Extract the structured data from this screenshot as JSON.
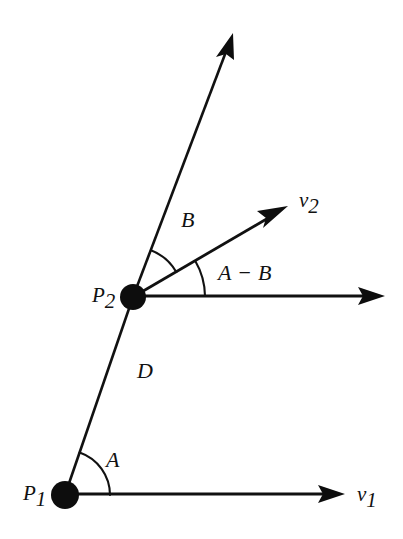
{
  "figure": {
    "background_color": "#ffffff",
    "stroke_color": "#111111",
    "node_color": "#0d0d0d",
    "width": 403,
    "height": 539
  },
  "points": {
    "p1": {
      "label_base": "P",
      "label_sub": "1",
      "x": 65,
      "y": 495,
      "radius": 14
    },
    "p2": {
      "label_base": "P",
      "label_sub": "2",
      "x": 133,
      "y": 297,
      "radius": 13
    }
  },
  "vectors": {
    "v1": {
      "label_base": "v",
      "label_sub": "1",
      "origin": "p1",
      "tip_x": 345,
      "tip_y": 494,
      "direction_deg": 0
    },
    "v2": {
      "label_base": "v",
      "label_sub": "2",
      "origin": "p2",
      "tip_x": 288,
      "tip_y": 206,
      "direction_deg": 30
    },
    "up_ray": {
      "origin": "p2",
      "tip_x": 233,
      "tip_y": 33,
      "direction_deg": 69
    },
    "horizontal_ray_p2": {
      "origin": "p2",
      "tip_x": 385,
      "tip_y": 296,
      "direction_deg": 0
    }
  },
  "segments": {
    "d": {
      "label": "D",
      "from": "p1",
      "to": "p2",
      "label_x": 137,
      "label_y": 378
    }
  },
  "angles": {
    "a": {
      "label": "A",
      "vertex": "p1",
      "label_x": 106,
      "label_y": 467,
      "arc_radius": 45,
      "start_deg": 0,
      "end_deg": 71
    },
    "b": {
      "label": "B",
      "vertex": "p2",
      "label_x": 181,
      "label_y": 227,
      "arc_radius": 50,
      "start_deg": 30,
      "end_deg": 69
    },
    "a_minus_b": {
      "label_left": "A",
      "label_operator": "−",
      "label_right": "B",
      "vertex": "p2",
      "label_x": 218,
      "label_y": 280,
      "arc_radius": 72,
      "start_deg": 0,
      "end_deg": 30
    }
  }
}
